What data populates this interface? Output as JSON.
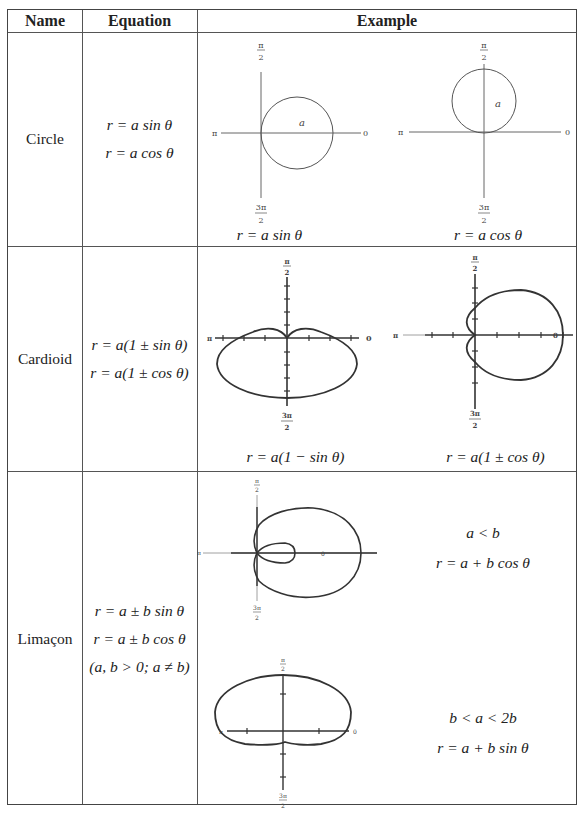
{
  "table": {
    "headers": [
      "Name",
      "Equation",
      "Example"
    ],
    "rows": [
      {
        "name": "Circle",
        "equations": [
          "r = a sin θ",
          "r = a cos θ"
        ],
        "examples": [
          {
            "caption": "r = a sin θ",
            "label": "a",
            "type": "circle-right"
          },
          {
            "caption": "r = a cos θ",
            "label": "a",
            "type": "circle-up"
          }
        ]
      },
      {
        "name": "Cardioid",
        "equations": [
          "r = a(1 ± sin θ)",
          "r = a(1 ± cos θ)"
        ],
        "examples": [
          {
            "caption": "r = a(1 − sin θ)",
            "type": "cardioid-down"
          },
          {
            "caption": "r = a(1 ± cos θ)",
            "type": "cardioid-right"
          }
        ]
      },
      {
        "name": "Limaçon",
        "equations": [
          "r = a ± b sin θ",
          "r = a ± b cos θ",
          "(a, b > 0; a ≠ b)"
        ],
        "examples": [
          {
            "condition": "a < b",
            "equation": "r = a + b cos θ",
            "type": "limacon-inner-loop"
          },
          {
            "condition": "b < a < 2b",
            "equation": "r = a + b sin θ",
            "type": "limacon-dimpled"
          }
        ]
      }
    ]
  },
  "axis_labels": {
    "top_num": "π",
    "top_den": "2",
    "bottom_num": "3π",
    "bottom_den": "2",
    "left": "π",
    "right": "0"
  }
}
